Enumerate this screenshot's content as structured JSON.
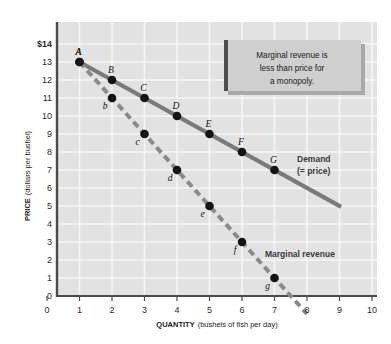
{
  "chart_data": {
    "type": "line",
    "title": "",
    "xlabel_bold": "QUANTITY",
    "xlabel_sub": "(bushels of fish per day)",
    "ylabel_bold": "PRICE",
    "ylabel_sub": "(dollars per bushel)",
    "xlim": [
      0,
      10
    ],
    "ylim": [
      0,
      14
    ],
    "grid": true,
    "x_ticks": [
      "0",
      "1",
      "2",
      "3",
      "4",
      "5",
      "6",
      "7",
      "8",
      "9",
      "10"
    ],
    "y_ticks": [
      "0",
      "1",
      "2",
      "3",
      "4",
      "5",
      "6",
      "7",
      "8",
      "9",
      "10",
      "11",
      "12",
      "13",
      "$14"
    ],
    "legend_position": "inline-right",
    "series": [
      {
        "name": "Demand (= price)",
        "label_line1": "Demand",
        "label_line2": "(= price)",
        "style": "solid",
        "color": "#7a7a7a",
        "x": [
          1,
          2,
          3,
          4,
          5,
          6,
          7
        ],
        "values": [
          13,
          12,
          11,
          10,
          9,
          8,
          7
        ],
        "point_labels": [
          "A",
          "B",
          "C",
          "D",
          "E",
          "F",
          "G"
        ],
        "line_extends_to_x": 9.05,
        "line_extends_to_y": 4.95
      },
      {
        "name": "Marginal revenue",
        "label_line1": "Marginal revenue",
        "label_line2": "",
        "style": "dashed",
        "color": "#8a8a8a",
        "x": [
          1,
          2,
          3,
          4,
          5,
          6,
          7
        ],
        "values": [
          13,
          11,
          9,
          7,
          5,
          3,
          1
        ],
        "point_labels": [
          "A",
          "b",
          "c",
          "d",
          "e",
          "f",
          "g"
        ],
        "line_extends_to_x": 8.0,
        "line_extends_to_y": -1.0
      }
    ],
    "annotations": [
      {
        "name": "callout",
        "lines": [
          "Marginal revenue is",
          "less than price for",
          "a monopoly."
        ],
        "x_range": [
          5.1,
          9.4
        ],
        "y_range": [
          10.6,
          13.2
        ]
      }
    ]
  },
  "colors": {
    "plot_background": "#e2e2e2",
    "page_background": "#ffffff",
    "gridline": "#f6f6f6",
    "axis": "#4a4a4a",
    "demand_line": "#7a7a7a",
    "mr_line": "#8a8a8a",
    "point_fill": "#141414",
    "callout_fill": "#cfcfcf",
    "callout_bar": "#4d4d4d",
    "callout_shadow": "#a9a9a9",
    "text": "#1a1a1a"
  }
}
